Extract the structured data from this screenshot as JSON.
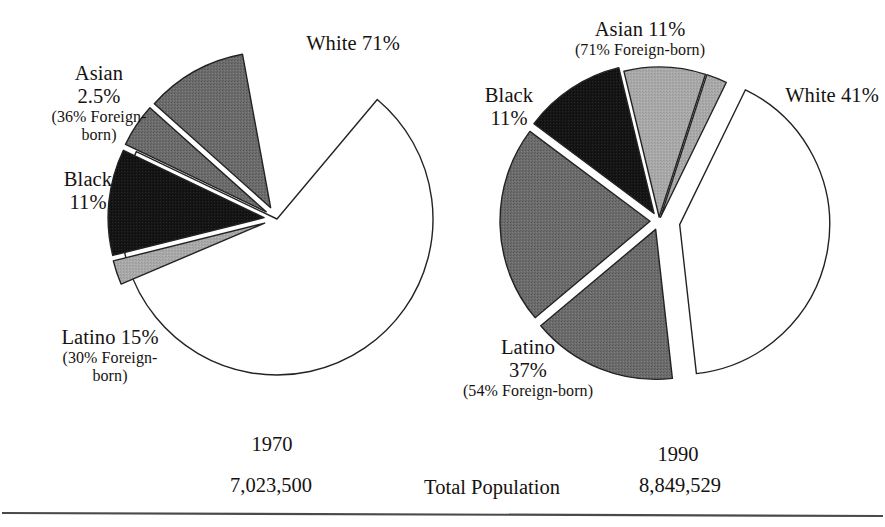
{
  "chart_data": {
    "type": "pie",
    "title": "",
    "charts": [
      {
        "name": "1970",
        "year_label": "1970",
        "total_population": "7,023,500",
        "center": [
          277,
          219
        ],
        "radius": 156,
        "slices": [
          {
            "name": "White",
            "label_main": "White 71%",
            "label_sub": "",
            "percent": 71,
            "fill": "#ffffff",
            "start_deg": -50,
            "end_deg": 205.6,
            "explode": 0
          },
          {
            "name": "Latino",
            "label_main": "Latino 15%",
            "label_sub": "(30% Foreign-born)",
            "percent": 15,
            "fill": "#6b6b6b",
            "start_deg": 205.6,
            "end_deg": 259.6,
            "explode": 13,
            "split_at_deg": 221.8
          },
          {
            "name": "Black",
            "label_main": "Black 11%",
            "label_sub": "",
            "percent": 11,
            "fill": "#141414",
            "start_deg": 166,
            "end_deg": 205.6,
            "explode": 13
          },
          {
            "name": "Asian",
            "label_main": "Asian 2.5%",
            "label_sub": "(36% Foreign-born)",
            "percent": 2.5,
            "fill": "#9e9e9e",
            "start_deg": 157,
            "end_deg": 166,
            "explode": 13
          }
        ]
      },
      {
        "name": "1990",
        "year_label": "1990",
        "total_population": "8,849,529",
        "center": [
          659,
          221
        ],
        "radius": 150,
        "slices": [
          {
            "name": "White",
            "label_main": "White 41%",
            "label_sub": "",
            "percent": 41,
            "fill": "#ffffff",
            "start_deg": -64,
            "end_deg": 83.6,
            "explode": 21
          },
          {
            "name": "Latino",
            "label_main": "Latino 37%",
            "label_sub": "(54% Foreign-born)",
            "percent": 37,
            "fill": "#6b6b6b",
            "start_deg": 83.6,
            "end_deg": 216.8,
            "explode": 9,
            "split_at_deg": 140
          },
          {
            "name": "Black",
            "label_main": "Black 11%",
            "label_sub": "",
            "percent": 11,
            "fill": "#141414",
            "start_deg": 216.8,
            "end_deg": 256.4,
            "explode": 9
          },
          {
            "name": "Asian",
            "label_main": "Asian 11%",
            "label_sub": "(71% Foreign-born)",
            "percent": 11,
            "fill": "#a8a8a8",
            "start_deg": 256.4,
            "end_deg": 296,
            "explode": 4,
            "split_at_deg": 288
          }
        ]
      }
    ]
  },
  "labels": {
    "asian_1970_main": "Asian",
    "asian_1970_pct": "2.5%",
    "asian_1970_sub1": "(36% Foreign-",
    "asian_1970_sub2": "born)",
    "black_1970_main": "Black",
    "black_1970_pct": "11%",
    "white_1970_main": "White 71%",
    "latino_1970_main": "Latino 15%",
    "latino_1970_sub1": "(30% Foreign-",
    "latino_1970_sub2": "born)",
    "asian_1990_main": "Asian 11%",
    "asian_1990_sub": "(71% Foreign-born)",
    "black_1990_main": "Black",
    "black_1990_pct": "11%",
    "white_1990_main": "White 41%",
    "latino_1990_main": "Latino",
    "latino_1990_pct": "37%",
    "latino_1990_sub": "(54% Foreign-born)"
  },
  "footer": {
    "year_left": "1970",
    "year_right": "1990",
    "total_left": "7,023,500",
    "total_center_label": "Total Population",
    "total_right": "8,849,529"
  },
  "style": {
    "stroke": "#232323",
    "background": "#ffffff",
    "rule_color": "#4a4a4a"
  }
}
